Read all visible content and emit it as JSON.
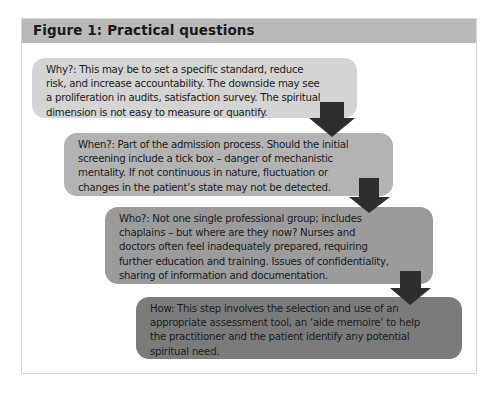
{
  "figure": {
    "title": "Figure 1: Practical questions",
    "colors": {
      "header_bg": "#b9b9b9",
      "frame_border": "#d6d6d6",
      "arrow": "#2e2e2e"
    },
    "steps": [
      {
        "label": "Why?",
        "color": "#d4d4d4",
        "lines": [
          "Why?: This may be to set a specific standard, reduce",
          "risk, and increase accountability. The downside may see",
          "a proliferation in audits, satisfaction survey. The spiritual",
          "dimension is not easy to measure or quantify."
        ]
      },
      {
        "label": "When?",
        "color": "#b3b3b3",
        "lines": [
          "When?: Part of the admission process. Should the initial",
          "screening include a tick box – danger of mechanistic",
          "mentality. If not continuous in nature, fluctuation or",
          "changes in the patient’s state may not be detected."
        ]
      },
      {
        "label": "Who?",
        "color": "#9b9b9b",
        "lines": [
          "Who?: Not one single professional group; includes",
          "chaplains – but where are they now? Nurses and",
          "doctors often feel inadequately prepared, requiring",
          "further education and training. Issues of confidentiality,",
          "sharing of information and documentation."
        ]
      },
      {
        "label": "How",
        "color": "#7b7b7b",
        "lines": [
          "How: This step involves the selection and use of an",
          "appropriate assessment tool, an ‘aide memoire’ to help",
          "the practitioner and the patient identify any potential",
          "spiritual need."
        ]
      }
    ]
  }
}
